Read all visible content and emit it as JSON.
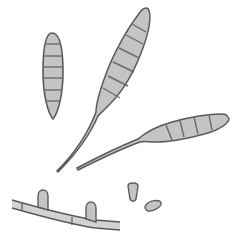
{
  "illustration": {
    "subject": "fungal conidia and conidiophores",
    "colors": {
      "background": "#ffffff",
      "fill": "#c4c4c4",
      "fill_light": "#d2d2d2",
      "outline": "#5a5a5a",
      "septum": "#6a6a6a"
    },
    "elements": [
      {
        "name": "conidium-septate-upright",
        "septa": 6
      },
      {
        "name": "conidium-beaked-large",
        "septa": 6
      },
      {
        "name": "conidium-beaked-horizontal",
        "septa": 4
      },
      {
        "name": "hypha-with-conidiophores",
        "branches": 2
      },
      {
        "name": "young-conidium-small-1"
      },
      {
        "name": "young-conidium-small-2"
      }
    ]
  }
}
